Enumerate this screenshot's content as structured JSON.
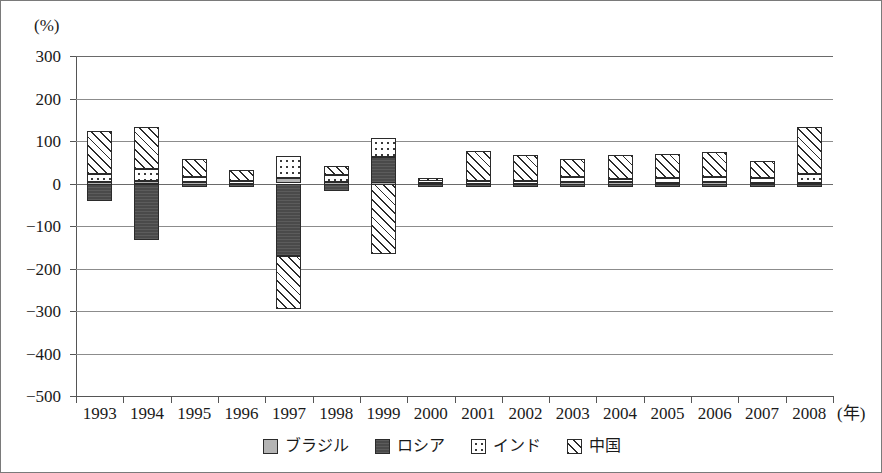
{
  "chart_data": {
    "type": "bar",
    "subtype": "stacked-bar-signed",
    "title": "",
    "xlabel": "(年)",
    "ylabel": "(%)",
    "unit_label": "(%)",
    "xaxis_unit": "(年)",
    "ylim": [
      -500,
      300
    ],
    "yticks": [
      300,
      200,
      100,
      0,
      -100,
      -200,
      -300,
      -400,
      -500
    ],
    "ytick_labels": [
      "300",
      "200",
      "100",
      "0",
      "−100",
      "−200",
      "−300",
      "−400",
      "−500"
    ],
    "grid": true,
    "legend_position": "bottom-center",
    "categories": [
      "1993",
      "1994",
      "1995",
      "1996",
      "1997",
      "1998",
      "1999",
      "2000",
      "2001",
      "2002",
      "2003",
      "2004",
      "2005",
      "2006",
      "2007",
      "2008"
    ],
    "series": [
      {
        "name": "ブラジル",
        "key": "brazil",
        "color": "#b4b4b4",
        "pattern": "solid-light-gray",
        "values": [
          4,
          5,
          3,
          2,
          12,
          4,
          3,
          2,
          2,
          2,
          3,
          3,
          2,
          3,
          2,
          2
        ]
      },
      {
        "name": "ロシア",
        "key": "russia",
        "color": "#4a4a4a",
        "pattern": "solid-dark-gray",
        "values": [
          -40,
          -133,
          -6,
          -4,
          -170,
          -18,
          62,
          -3,
          -7,
          -7,
          -8,
          -9,
          -6,
          -7,
          -6,
          -8
        ]
      },
      {
        "name": "インド",
        "key": "india",
        "color": "#ffffff",
        "pattern": "dotted",
        "values": [
          18,
          30,
          12,
          5,
          52,
          16,
          45,
          9,
          5,
          5,
          12,
          7,
          10,
          12,
          10,
          20
        ]
      },
      {
        "name": "中国",
        "key": "china",
        "color": "#ffffff",
        "pattern": "diagonal-hatch",
        "values": [
          102,
          98,
          42,
          25,
          -125,
          22,
          -165,
          3,
          70,
          60,
          42,
          56,
          58,
          60,
          40,
          110
        ]
      }
    ],
    "bars": [
      {
        "year": "1993",
        "segments": [
          {
            "series": "brazil",
            "from": 0,
            "to": 4
          },
          {
            "series": "india",
            "from": 4,
            "to": 22
          },
          {
            "series": "china",
            "from": 22,
            "to": 124
          },
          {
            "series": "russia",
            "from": 0,
            "to": -40
          }
        ]
      },
      {
        "year": "1994",
        "segments": [
          {
            "series": "brazil",
            "from": 0,
            "to": 5
          },
          {
            "series": "india",
            "from": 5,
            "to": 35
          },
          {
            "series": "china",
            "from": 35,
            "to": 133
          },
          {
            "series": "russia",
            "from": 0,
            "to": -133
          }
        ]
      },
      {
        "year": "1995",
        "segments": [
          {
            "series": "brazil",
            "from": 0,
            "to": 3
          },
          {
            "series": "india",
            "from": 3,
            "to": 15
          },
          {
            "series": "china",
            "from": 15,
            "to": 57
          },
          {
            "series": "russia",
            "from": 0,
            "to": -6
          }
        ]
      },
      {
        "year": "1996",
        "segments": [
          {
            "series": "brazil",
            "from": 0,
            "to": 2
          },
          {
            "series": "india",
            "from": 2,
            "to": 7
          },
          {
            "series": "china",
            "from": 7,
            "to": 32
          },
          {
            "series": "russia",
            "from": 0,
            "to": -4
          }
        ]
      },
      {
        "year": "1997",
        "segments": [
          {
            "series": "brazil",
            "from": 0,
            "to": 12
          },
          {
            "series": "india",
            "from": 12,
            "to": 64
          },
          {
            "series": "russia",
            "from": 0,
            "to": -170
          },
          {
            "series": "china",
            "from": -170,
            "to": -295
          }
        ]
      },
      {
        "year": "1998",
        "segments": [
          {
            "series": "brazil",
            "from": 0,
            "to": 4
          },
          {
            "series": "india",
            "from": 4,
            "to": 20
          },
          {
            "series": "china",
            "from": 20,
            "to": 42
          },
          {
            "series": "russia",
            "from": 0,
            "to": -18
          }
        ]
      },
      {
        "year": "1999",
        "segments": [
          {
            "series": "russia",
            "from": 0,
            "to": 62
          },
          {
            "series": "india",
            "from": 62,
            "to": 107
          },
          {
            "series": "brazil",
            "from": 0,
            "to": 3
          },
          {
            "series": "china",
            "from": 0,
            "to": -165
          }
        ]
      },
      {
        "year": "2000",
        "segments": [
          {
            "series": "brazil",
            "from": 0,
            "to": 2
          },
          {
            "series": "india",
            "from": 2,
            "to": 11
          },
          {
            "series": "china",
            "from": 11,
            "to": 14
          },
          {
            "series": "russia",
            "from": 0,
            "to": -3
          }
        ]
      },
      {
        "year": "2001",
        "segments": [
          {
            "series": "brazil",
            "from": 0,
            "to": 2
          },
          {
            "series": "india",
            "from": 2,
            "to": 7
          },
          {
            "series": "china",
            "from": 7,
            "to": 77
          },
          {
            "series": "russia",
            "from": 0,
            "to": -7
          }
        ]
      },
      {
        "year": "2002",
        "segments": [
          {
            "series": "brazil",
            "from": 0,
            "to": 2
          },
          {
            "series": "india",
            "from": 2,
            "to": 7
          },
          {
            "series": "china",
            "from": 7,
            "to": 67
          },
          {
            "series": "russia",
            "from": 0,
            "to": -7
          }
        ]
      },
      {
        "year": "2003",
        "segments": [
          {
            "series": "brazil",
            "from": 0,
            "to": 3
          },
          {
            "series": "india",
            "from": 3,
            "to": 15
          },
          {
            "series": "china",
            "from": 15,
            "to": 57
          },
          {
            "series": "russia",
            "from": 0,
            "to": -8
          }
        ]
      },
      {
        "year": "2004",
        "segments": [
          {
            "series": "brazil",
            "from": 0,
            "to": 3
          },
          {
            "series": "india",
            "from": 3,
            "to": 10
          },
          {
            "series": "china",
            "from": 10,
            "to": 66
          },
          {
            "series": "russia",
            "from": 0,
            "to": -9
          }
        ]
      },
      {
        "year": "2005",
        "segments": [
          {
            "series": "brazil",
            "from": 0,
            "to": 2
          },
          {
            "series": "india",
            "from": 2,
            "to": 12
          },
          {
            "series": "china",
            "from": 12,
            "to": 70
          },
          {
            "series": "russia",
            "from": 0,
            "to": -6
          }
        ]
      },
      {
        "year": "2006",
        "segments": [
          {
            "series": "brazil",
            "from": 0,
            "to": 3
          },
          {
            "series": "india",
            "from": 3,
            "to": 15
          },
          {
            "series": "china",
            "from": 15,
            "to": 75
          },
          {
            "series": "russia",
            "from": 0,
            "to": -7
          }
        ]
      },
      {
        "year": "2007",
        "segments": [
          {
            "series": "brazil",
            "from": 0,
            "to": 2
          },
          {
            "series": "india",
            "from": 2,
            "to": 12
          },
          {
            "series": "china",
            "from": 12,
            "to": 52
          },
          {
            "series": "russia",
            "from": 0,
            "to": -6
          }
        ]
      },
      {
        "year": "2008",
        "segments": [
          {
            "series": "brazil",
            "from": 0,
            "to": 2
          },
          {
            "series": "india",
            "from": 2,
            "to": 22
          },
          {
            "series": "china",
            "from": 22,
            "to": 132
          },
          {
            "series": "russia",
            "from": 0,
            "to": -8
          }
        ]
      }
    ],
    "legend": [
      {
        "label": "ブラジル",
        "key": "brazil"
      },
      {
        "label": "ロシア",
        "key": "russia"
      },
      {
        "label": "インド",
        "key": "india"
      },
      {
        "label": "中国",
        "key": "china"
      }
    ]
  }
}
